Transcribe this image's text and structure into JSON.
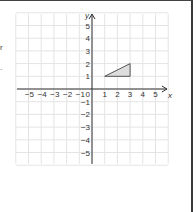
{
  "left_fragments": {
    "glyph": "r",
    "dot": "."
  },
  "chart_data": {
    "type": "area",
    "title": "",
    "xlabel": "x",
    "ylabel": "y",
    "xlim": [
      -5.9,
      6.0
    ],
    "ylim": [
      -6.0,
      6.0
    ],
    "grid": true,
    "x_ticks": [
      "-5",
      "-4",
      "-3",
      "-2",
      "-1",
      "0",
      "1",
      "2",
      "3",
      "4",
      "5"
    ],
    "y_ticks_pos": [
      "1",
      "2",
      "3",
      "4",
      "5"
    ],
    "y_ticks_neg": [
      "-1",
      "-2",
      "-3",
      "-4",
      "-5"
    ],
    "shapes": [
      {
        "type": "polygon",
        "name": "triangle",
        "vertices": [
          [
            1,
            1
          ],
          [
            3,
            2
          ],
          [
            3,
            1
          ]
        ],
        "fill": "#dddddd",
        "stroke": "#555555"
      }
    ],
    "colors": {
      "grid": "#e4e4e4",
      "axis": "#333333",
      "text": "#333333"
    }
  }
}
